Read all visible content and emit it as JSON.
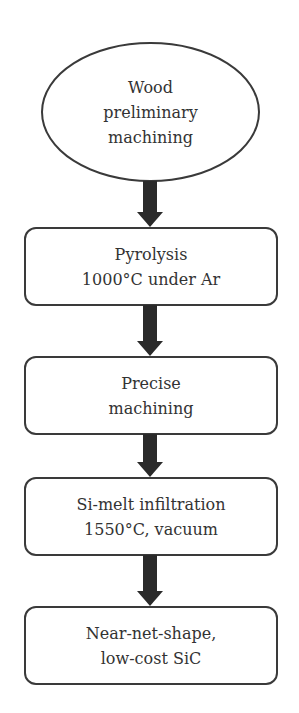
{
  "diagram": {
    "type": "flowchart",
    "direction": "top-to-bottom",
    "colors": {
      "stroke": "#3a3a3a",
      "text": "#333333",
      "arrow": "#2a2a2a",
      "background": "#ffffff"
    },
    "nodes": [
      {
        "id": "n0",
        "shape": "ellipse",
        "lines": [
          "Wood",
          "preliminary",
          "machining"
        ]
      },
      {
        "id": "n1",
        "shape": "rounded-rect",
        "lines": [
          "Pyrolysis",
          "1000°C under Ar"
        ]
      },
      {
        "id": "n2",
        "shape": "rounded-rect",
        "lines": [
          "Precise",
          "machining"
        ]
      },
      {
        "id": "n3",
        "shape": "rounded-rect",
        "lines": [
          "Si-melt infiltration",
          "1550°C, vacuum"
        ]
      },
      {
        "id": "n4",
        "shape": "rounded-rect",
        "lines": [
          "Near-net-shape,",
          "low-cost SiC"
        ]
      }
    ],
    "edges": [
      {
        "from": "n0",
        "to": "n1"
      },
      {
        "from": "n1",
        "to": "n2"
      },
      {
        "from": "n2",
        "to": "n3"
      },
      {
        "from": "n3",
        "to": "n4"
      }
    ]
  }
}
